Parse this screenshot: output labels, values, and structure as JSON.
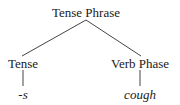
{
  "diagram": {
    "type": "syntax-tree",
    "root": {
      "label": "Tense Phrase",
      "children": [
        {
          "label": "Tense",
          "children": [
            {
              "label": "-s",
              "style": "italic"
            }
          ]
        },
        {
          "label": "Verb Phase",
          "children": [
            {
              "label": "cough",
              "style": "italic"
            }
          ]
        }
      ]
    },
    "nodes": {
      "root": "Tense Phrase",
      "left": "Tense",
      "right": "Verb Phase",
      "left_leaf": "-s",
      "right_leaf": "cough"
    },
    "colors": {
      "text": "#1a1a1a",
      "lines": "#444444",
      "background": "#ffffff"
    }
  }
}
